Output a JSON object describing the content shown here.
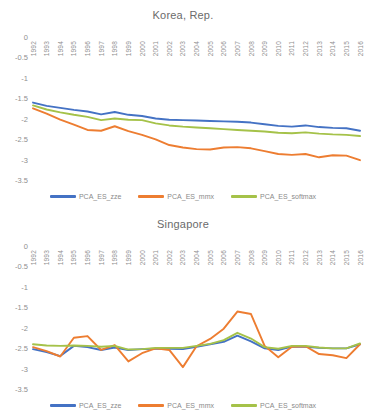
{
  "charts": [
    {
      "title": "Korea, Rep.",
      "legend": [
        {
          "label": "PCA_ES_zze",
          "color": "#4472C4"
        },
        {
          "label": "PCA_ES_mmx",
          "color": "#ED7D31"
        },
        {
          "label": "PCA_ES_softmax",
          "color": "#A5C249"
        }
      ]
    },
    {
      "title": "Singapore",
      "legend": [
        {
          "label": "PCA_ES_zze",
          "color": "#4472C4"
        },
        {
          "label": "PCA_ES_mmx",
          "color": "#ED7D31"
        },
        {
          "label": "PCA_ES_softmax",
          "color": "#A5C249"
        }
      ]
    }
  ],
  "chart_data": [
    {
      "type": "line",
      "title": "Korea, Rep.",
      "xlabel": "",
      "ylabel": "",
      "ylim": [
        -3.5,
        0
      ],
      "yticks": [
        0,
        -0.5,
        -1,
        -1.5,
        -2,
        -2.5,
        -3,
        -3.5
      ],
      "ytick_labels": [
        "0",
        "-0.5",
        "-1",
        "-1.5",
        "-2",
        "-2.5",
        "-3",
        "-3.5"
      ],
      "grid": false,
      "legend_position": "bottom",
      "categories": [
        1992,
        1993,
        1994,
        1995,
        1996,
        1997,
        1998,
        1999,
        2000,
        2001,
        2002,
        2003,
        2004,
        2005,
        2006,
        2007,
        2008,
        2009,
        2010,
        2011,
        2012,
        2013,
        2014,
        2015,
        2016
      ],
      "series": [
        {
          "name": "PCA_ES_zze",
          "color": "#4472C4",
          "values": [
            -1.58,
            -1.66,
            -1.71,
            -1.76,
            -1.8,
            -1.87,
            -1.81,
            -1.88,
            -1.91,
            -1.97,
            -2.0,
            -2.01,
            -2.02,
            -2.03,
            -2.04,
            -2.05,
            -2.07,
            -2.11,
            -2.15,
            -2.17,
            -2.14,
            -2.18,
            -2.2,
            -2.21,
            -2.27
          ]
        },
        {
          "name": "PCA_ES_mmx",
          "color": "#ED7D31",
          "values": [
            -1.72,
            -1.85,
            -2.0,
            -2.12,
            -2.25,
            -2.27,
            -2.16,
            -2.28,
            -2.37,
            -2.48,
            -2.62,
            -2.68,
            -2.72,
            -2.73,
            -2.68,
            -2.67,
            -2.7,
            -2.77,
            -2.84,
            -2.86,
            -2.84,
            -2.92,
            -2.87,
            -2.88,
            -2.99
          ]
        },
        {
          "name": "PCA_ES_softmax",
          "color": "#A5C249",
          "values": [
            -1.65,
            -1.75,
            -1.82,
            -1.88,
            -1.93,
            -2.01,
            -1.97,
            -2.0,
            -2.01,
            -2.09,
            -2.14,
            -2.17,
            -2.19,
            -2.21,
            -2.23,
            -2.25,
            -2.27,
            -2.29,
            -2.32,
            -2.33,
            -2.31,
            -2.34,
            -2.36,
            -2.37,
            -2.4
          ]
        }
      ]
    },
    {
      "type": "line",
      "title": "Singapore",
      "xlabel": "",
      "ylabel": "",
      "ylim": [
        -3.5,
        0
      ],
      "yticks": [
        0,
        -0.5,
        -1,
        -1.5,
        -2,
        -2.5,
        -3,
        -3.5
      ],
      "ytick_labels": [
        "0",
        "-0.5",
        "-1",
        "-1.5",
        "-2",
        "-2.5",
        "-3",
        "-3.5"
      ],
      "grid": false,
      "legend_position": "bottom",
      "categories": [
        1992,
        1993,
        1994,
        1995,
        1996,
        1997,
        1998,
        1999,
        2000,
        2001,
        2002,
        2003,
        2004,
        2005,
        2006,
        2007,
        2008,
        2009,
        2010,
        2011,
        2012,
        2013,
        2014,
        2015,
        2016
      ],
      "series": [
        {
          "name": "PCA_ES_zze",
          "color": "#4472C4",
          "values": [
            -2.5,
            -2.57,
            -2.67,
            -2.42,
            -2.45,
            -2.52,
            -2.46,
            -2.52,
            -2.5,
            -2.49,
            -2.49,
            -2.5,
            -2.44,
            -2.38,
            -2.32,
            -2.17,
            -2.31,
            -2.48,
            -2.52,
            -2.44,
            -2.44,
            -2.47,
            -2.48,
            -2.48,
            -2.38
          ]
        },
        {
          "name": "PCA_ES_mmx",
          "color": "#ED7D31",
          "values": [
            -2.45,
            -2.55,
            -2.68,
            -2.22,
            -2.18,
            -2.52,
            -2.4,
            -2.8,
            -2.6,
            -2.48,
            -2.52,
            -2.94,
            -2.43,
            -2.25,
            -2.0,
            -1.58,
            -1.64,
            -2.42,
            -2.7,
            -2.44,
            -2.43,
            -2.62,
            -2.65,
            -2.72,
            -2.38
          ]
        },
        {
          "name": "PCA_ES_softmax",
          "color": "#A5C249",
          "values": [
            -2.38,
            -2.41,
            -2.42,
            -2.41,
            -2.42,
            -2.44,
            -2.42,
            -2.51,
            -2.5,
            -2.47,
            -2.47,
            -2.47,
            -2.42,
            -2.37,
            -2.28,
            -2.1,
            -2.24,
            -2.45,
            -2.49,
            -2.42,
            -2.42,
            -2.46,
            -2.48,
            -2.48,
            -2.36
          ]
        }
      ]
    }
  ]
}
